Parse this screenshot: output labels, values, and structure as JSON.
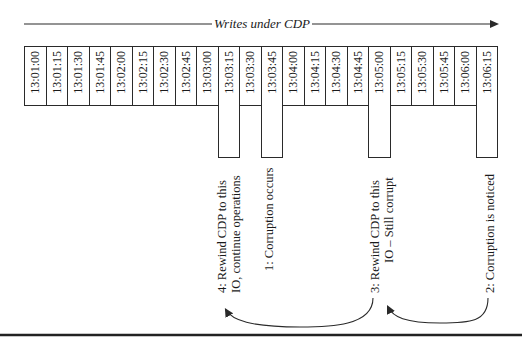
{
  "diagram": {
    "title": "Writes under CDP",
    "timeline": [
      {
        "time": "13:01:00",
        "highlight": false
      },
      {
        "time": "13:01:15",
        "highlight": false
      },
      {
        "time": "13:01:30",
        "highlight": false
      },
      {
        "time": "13:01:45",
        "highlight": false
      },
      {
        "time": "13:02:00",
        "highlight": false
      },
      {
        "time": "13:02:15",
        "highlight": false
      },
      {
        "time": "13:02:30",
        "highlight": false
      },
      {
        "time": "13:02:45",
        "highlight": false
      },
      {
        "time": "13:03:00",
        "highlight": false
      },
      {
        "time": "13:03:15",
        "highlight": true
      },
      {
        "time": "13:03:30",
        "highlight": false
      },
      {
        "time": "13:03:45",
        "highlight": true
      },
      {
        "time": "13:04:00",
        "highlight": false
      },
      {
        "time": "13:04:15",
        "highlight": false
      },
      {
        "time": "13:04:30",
        "highlight": false
      },
      {
        "time": "13:04:45",
        "highlight": false
      },
      {
        "time": "13:05:00",
        "highlight": true
      },
      {
        "time": "13:05:15",
        "highlight": false
      },
      {
        "time": "13:05:30",
        "highlight": false
      },
      {
        "time": "13:05:45",
        "highlight": false
      },
      {
        "time": "13:06:00",
        "highlight": false
      },
      {
        "time": "13:06:15",
        "highlight": true
      }
    ],
    "annotations": {
      "step4": {
        "line1": "4: Rewind CDP to this",
        "line2": "IO, continue operations",
        "time": "13:03:15"
      },
      "step1": {
        "line1": "1: Corruption occurs",
        "time": "13:03:45"
      },
      "step3": {
        "line1": "3: Rewind CDP to this",
        "line2": "IO – Still corrupt",
        "time": "13:05:00"
      },
      "step2": {
        "line1": "2: Corruption is noticed",
        "time": "13:06:15"
      }
    },
    "colors": {
      "line": "#2a2a2a",
      "text": "#1a1a1a",
      "background": "#ffffff"
    }
  }
}
